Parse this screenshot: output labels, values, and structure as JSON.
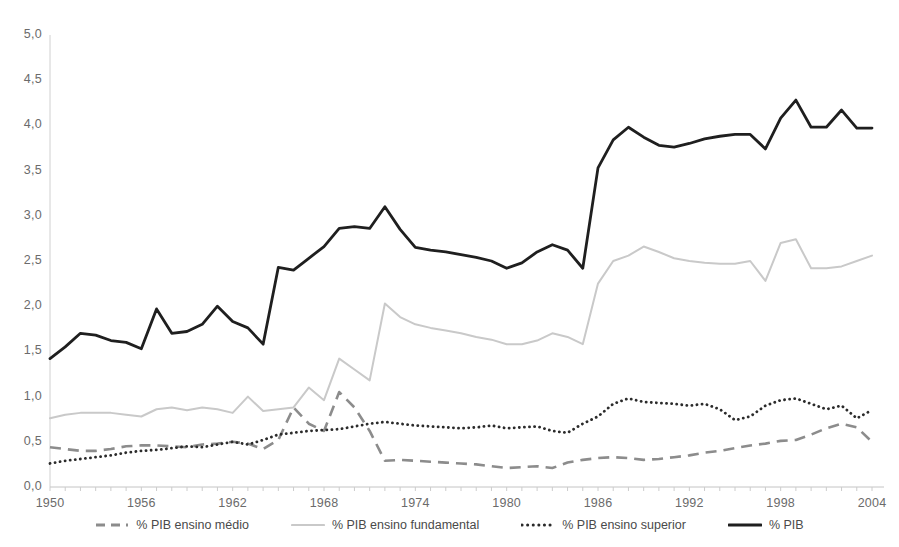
{
  "chart_data": {
    "type": "line",
    "title": "",
    "xlabel": "",
    "ylabel": "",
    "xlim": [
      1950,
      2004
    ],
    "ylim": [
      0.0,
      5.0
    ],
    "grid": false,
    "legend_position": "bottom",
    "decimal_separator": ",",
    "y_ticks": [
      "0,0",
      "0,5",
      "1,0",
      "1,5",
      "2,0",
      "2,5",
      "3,0",
      "3,5",
      "4,0",
      "4,5",
      "5,0"
    ],
    "y_tick_values": [
      0.0,
      0.5,
      1.0,
      1.5,
      2.0,
      2.5,
      3.0,
      3.5,
      4.0,
      4.5,
      5.0
    ],
    "x_ticks": [
      "1950",
      "1956",
      "1962",
      "1968",
      "1974",
      "1980",
      "1986",
      "1992",
      "1998",
      "2004"
    ],
    "x_tick_values": [
      1950,
      1956,
      1962,
      1968,
      1974,
      1980,
      1986,
      1992,
      1998,
      2004
    ],
    "x": [
      1950,
      1951,
      1952,
      1953,
      1954,
      1955,
      1956,
      1957,
      1958,
      1959,
      1960,
      1961,
      1962,
      1963,
      1964,
      1965,
      1966,
      1967,
      1968,
      1969,
      1970,
      1971,
      1972,
      1973,
      1974,
      1975,
      1976,
      1977,
      1978,
      1979,
      1980,
      1981,
      1982,
      1983,
      1984,
      1985,
      1986,
      1987,
      1988,
      1989,
      1990,
      1991,
      1992,
      1993,
      1994,
      1995,
      1996,
      1997,
      1998,
      1999,
      2000,
      2001,
      2002,
      2003,
      2004
    ],
    "series": [
      {
        "name": "% PIB ensino médio",
        "style": "dashed",
        "color": "#8c8c8c",
        "values": [
          0.44,
          0.42,
          0.4,
          0.4,
          0.42,
          0.45,
          0.46,
          0.46,
          0.45,
          0.44,
          0.47,
          0.48,
          0.5,
          0.48,
          0.42,
          0.52,
          0.88,
          0.7,
          0.62,
          1.05,
          0.88,
          0.62,
          0.29,
          0.3,
          0.29,
          0.28,
          0.27,
          0.26,
          0.25,
          0.23,
          0.21,
          0.22,
          0.23,
          0.21,
          0.27,
          0.3,
          0.32,
          0.33,
          0.32,
          0.3,
          0.31,
          0.33,
          0.35,
          0.38,
          0.4,
          0.43,
          0.46,
          0.48,
          0.51,
          0.52,
          0.58,
          0.65,
          0.7,
          0.66,
          0.5
        ]
      },
      {
        "name": "% PIB ensino fundamental",
        "style": "solid-light",
        "color": "#c9c9c9",
        "values": [
          0.76,
          0.8,
          0.82,
          0.82,
          0.82,
          0.8,
          0.78,
          0.86,
          0.88,
          0.85,
          0.88,
          0.86,
          0.82,
          1.0,
          0.84,
          0.86,
          0.88,
          1.1,
          0.96,
          1.42,
          1.3,
          1.18,
          2.03,
          1.88,
          1.8,
          1.76,
          1.73,
          1.7,
          1.66,
          1.63,
          1.58,
          1.58,
          1.62,
          1.7,
          1.66,
          1.58,
          2.25,
          2.5,
          2.56,
          2.66,
          2.6,
          2.53,
          2.5,
          2.48,
          2.47,
          2.47,
          2.5,
          2.28,
          2.7,
          2.74,
          2.42,
          2.42,
          2.44,
          2.5,
          2.56
        ]
      },
      {
        "name": "% PIB ensino superior",
        "style": "dotted",
        "color": "#2b2b2b",
        "values": [
          0.26,
          0.29,
          0.31,
          0.33,
          0.35,
          0.38,
          0.4,
          0.41,
          0.43,
          0.45,
          0.44,
          0.47,
          0.5,
          0.47,
          0.52,
          0.58,
          0.6,
          0.62,
          0.63,
          0.64,
          0.67,
          0.7,
          0.72,
          0.7,
          0.68,
          0.67,
          0.66,
          0.65,
          0.66,
          0.68,
          0.65,
          0.66,
          0.67,
          0.62,
          0.6,
          0.7,
          0.78,
          0.92,
          0.98,
          0.94,
          0.93,
          0.92,
          0.9,
          0.92,
          0.86,
          0.74,
          0.78,
          0.9,
          0.96,
          0.98,
          0.92,
          0.86,
          0.9,
          0.76,
          0.85
        ]
      },
      {
        "name": "% PIB",
        "style": "solid-dark",
        "color": "#1f1f1f",
        "values": [
          1.42,
          1.55,
          1.7,
          1.68,
          1.62,
          1.6,
          1.53,
          1.97,
          1.7,
          1.72,
          1.8,
          2.0,
          1.83,
          1.76,
          1.58,
          2.43,
          2.4,
          2.53,
          2.66,
          2.86,
          2.88,
          2.86,
          3.1,
          2.85,
          2.65,
          2.62,
          2.6,
          2.57,
          2.54,
          2.5,
          2.42,
          2.48,
          2.6,
          2.68,
          2.62,
          2.42,
          3.53,
          3.84,
          3.98,
          3.87,
          3.78,
          3.76,
          3.8,
          3.85,
          3.88,
          3.9,
          3.9,
          3.74,
          4.08,
          4.28,
          3.98,
          3.98,
          4.17,
          3.97,
          3.97
        ]
      }
    ]
  },
  "legend": {
    "items": [
      {
        "label": "% PIB ensino médio"
      },
      {
        "label": "% PIB ensino fundamental"
      },
      {
        "label": "% PIB ensino superior"
      },
      {
        "label": "% PIB"
      }
    ]
  }
}
